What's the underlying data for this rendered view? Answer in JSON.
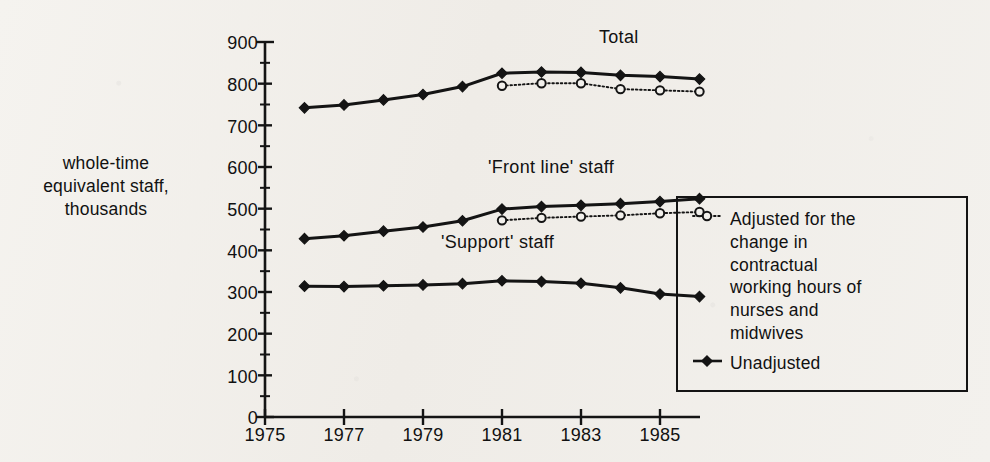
{
  "figure": {
    "y_axis_label": "whole-time equivalent staff,\nthousands",
    "y_axis_label_lines": [
      "whole-time",
      "equivalent staff,",
      "thousands"
    ],
    "series_annotations": {
      "total": "Total",
      "frontline": "'Front line' staff",
      "support": "'Support' staff"
    }
  },
  "legend": {
    "adjusted_marker": "open-circle-dotted",
    "adjusted_label": "Adjusted for the\nchange in\ncontractual\nworking hours of\nnurses and\nmidwives",
    "adjusted_label_lines": [
      "Adjusted for the",
      "change in",
      "contractual",
      "working hours of",
      "nurses and",
      "midwives"
    ],
    "unadjusted_marker": "filled-diamond-solid",
    "unadjusted_label": "Unadjusted"
  },
  "axes": {
    "y_ticks": [
      "0",
      "100",
      "200",
      "300",
      "400",
      "500",
      "600",
      "700",
      "800",
      "900"
    ],
    "x_ticks": [
      "1975",
      "1977",
      "1979",
      "1981",
      "1983",
      "1985"
    ]
  },
  "colors": {
    "ink": "#141414",
    "paper": "#f2f0ec"
  },
  "chart_data": {
    "type": "line",
    "title": "",
    "subtitle": "",
    "xlabel": "",
    "ylabel": "whole-time equivalent staff, thousands",
    "xlim": [
      1975,
      1986.5
    ],
    "ylim": [
      0,
      900
    ],
    "y_ticks": [
      0,
      100,
      200,
      300,
      400,
      500,
      600,
      700,
      800,
      900
    ],
    "x_ticks": [
      1975,
      1977,
      1979,
      1981,
      1983,
      1985
    ],
    "grid": false,
    "legend_position": "right",
    "legend_entries": [
      "Adjusted for the change in contractual working hours of nurses and midwives",
      "Unadjusted"
    ],
    "annotations": [
      {
        "text": "Total",
        "x": 1984.0,
        "y": 880
      },
      {
        "text": "'Front line' staff",
        "x": 1982.0,
        "y": 570
      },
      {
        "text": "'Support' staff",
        "x": 1981.3,
        "y": 405
      }
    ],
    "x": [
      1976,
      1977,
      1978,
      1979,
      1980,
      1981,
      1982,
      1983,
      1984,
      1985,
      1986
    ],
    "series": [
      {
        "name": "Total — Unadjusted",
        "group": "Total",
        "style": "solid",
        "marker": "filled-diamond",
        "x": [
          1976,
          1977,
          1978,
          1979,
          1980,
          1981,
          1982,
          1983,
          1984,
          1985,
          1986
        ],
        "values": [
          742,
          749,
          761,
          774,
          793,
          825,
          828,
          827,
          820,
          817,
          811
        ]
      },
      {
        "name": "Total — Adjusted",
        "group": "Total",
        "style": "dotted",
        "marker": "open-circle",
        "x": [
          1981,
          1982,
          1983,
          1984,
          1985,
          1986
        ],
        "values": [
          795,
          801,
          801,
          787,
          784,
          781
        ]
      },
      {
        "name": "'Front line' staff — Unadjusted",
        "group": "'Front line' staff",
        "style": "solid",
        "marker": "filled-diamond",
        "x": [
          1976,
          1977,
          1978,
          1979,
          1980,
          1981,
          1982,
          1983,
          1984,
          1985,
          1986
        ],
        "values": [
          428,
          435,
          446,
          456,
          471,
          499,
          505,
          508,
          512,
          517,
          524
        ]
      },
      {
        "name": "'Front line' staff — Adjusted",
        "group": "'Front line' staff",
        "style": "dotted",
        "marker": "open-circle",
        "x": [
          1981,
          1982,
          1983,
          1984,
          1985,
          1986
        ],
        "values": [
          472,
          478,
          481,
          484,
          489,
          492
        ]
      },
      {
        "name": "'Support' staff — Unadjusted",
        "group": "'Support' staff",
        "style": "solid",
        "marker": "filled-diamond",
        "x": [
          1976,
          1977,
          1978,
          1979,
          1980,
          1981,
          1982,
          1983,
          1984,
          1985,
          1986
        ],
        "values": [
          314,
          313,
          315,
          317,
          320,
          327,
          325,
          321,
          310,
          295,
          289
        ]
      }
    ]
  }
}
